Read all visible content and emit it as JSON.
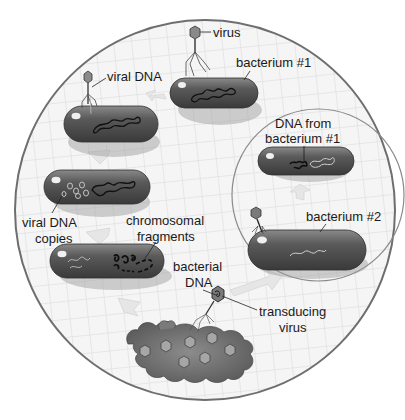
{
  "diagram": {
    "type": "biological process illustration",
    "colors": {
      "background": "#ffffff",
      "dish_fill": "#f4f4f4",
      "grid": "#d6d6d6",
      "dish_border": "#6e6e6e",
      "bacterium_dark": "#4a4a4a",
      "bacterium_light": "#9a9a9a",
      "arrow": "#e4e4e4",
      "label_text": "#1a1a1a"
    },
    "labels": {
      "virus": "virus",
      "bacterium1": "bacterium #1",
      "viral_dna": "viral DNA",
      "dna_from_1_line1": "DNA from",
      "dna_from_1_line2": "bacterium #1",
      "viral_dna_copies_line1": "viral DNA",
      "viral_dna_copies_line2": "copies",
      "chromosomal_line1": "chromosomal",
      "chromosomal_line2": "fragments",
      "bacterium2": "bacterium #2",
      "bacterial_dna_line1": "bacterial",
      "bacterial_dna_line2": "DNA",
      "transducing_line1": "transducing",
      "transducing_line2": "virus"
    },
    "stages": [
      {
        "id": 1,
        "description": "virus attaches to bacterium #1"
      },
      {
        "id": 2,
        "description": "viral DNA injected into bacterium"
      },
      {
        "id": 3,
        "description": "viral DNA copies made"
      },
      {
        "id": 4,
        "description": "bacterial chromosome broken into fragments"
      },
      {
        "id": 5,
        "description": "cell lyses, releasing viruses including a transducing virus carrying bacterial DNA"
      },
      {
        "id": 6,
        "description": "transducing virus infects bacterium #2"
      },
      {
        "id": 7,
        "description": "bacterium #2 contains DNA from bacterium #1"
      }
    ]
  }
}
